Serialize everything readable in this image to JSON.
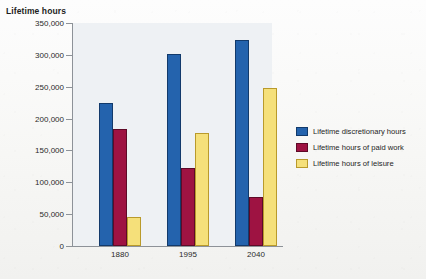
{
  "chart_data": {
    "type": "bar",
    "title": "Lifetime hours",
    "xlabel": "",
    "ylabel": "Lifetime hours",
    "categories": [
      "1880",
      "1995",
      "2040"
    ],
    "series": [
      {
        "name": "Lifetime discretionary hours",
        "color": "#2463ad",
        "values": [
          224000,
          301000,
          323000
        ]
      },
      {
        "name": "Lifetime hours of paid work",
        "color": "#9e1342",
        "values": [
          184000,
          122000,
          77000
        ]
      },
      {
        "name": "Lifetime hours of leisure",
        "color": "#f5e07a",
        "values": [
          46000,
          177000,
          248000
        ]
      }
    ],
    "ylim": [
      0,
      350000
    ],
    "yticks": [
      "0",
      "50,000",
      "100,000",
      "150,000",
      "200,000",
      "250,000",
      "300,000",
      "350,000"
    ],
    "ytick_values": [
      0,
      50000,
      100000,
      150000,
      200000,
      250000,
      300000,
      350000
    ],
    "grid": false,
    "legend_position": "right"
  },
  "legend": {
    "items": [
      {
        "label": "Lifetime discretionary hours"
      },
      {
        "label": "Lifetime hours of paid work"
      },
      {
        "label": "Lifetime hours of leisure"
      }
    ]
  }
}
